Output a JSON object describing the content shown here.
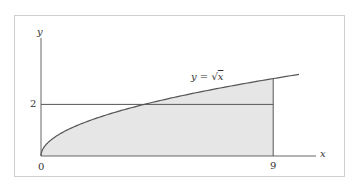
{
  "chart_data": {
    "type": "area",
    "title": "",
    "function_label": "y = √x",
    "function_label_parts": {
      "lhs": "y",
      "eq": "=",
      "radical": "√",
      "arg": "x"
    },
    "xlabel": "x",
    "ylabel": "y",
    "x_ticks": [
      {
        "value": 0,
        "label": "0"
      },
      {
        "value": 9,
        "label": "9"
      }
    ],
    "y_ticks": [
      {
        "value": 2,
        "label": "2"
      }
    ],
    "xlim": [
      0,
      10
    ],
    "ylim": [
      0,
      3.2
    ],
    "grid": false,
    "legend": null,
    "series": [
      {
        "name": "y = sqrt(x)",
        "kind": "curve",
        "x_range": [
          0,
          10
        ],
        "formula": "sqrt(x)"
      },
      {
        "name": "horizontal line y = 2",
        "kind": "hline",
        "y": 2,
        "x_range": [
          0,
          9
        ]
      },
      {
        "name": "vertical line x = 9",
        "kind": "vline",
        "x": 9,
        "y_range": [
          0,
          3
        ]
      },
      {
        "name": "shaded region under curve",
        "kind": "fill",
        "x_range": [
          0,
          9
        ],
        "under": "sqrt(x)"
      }
    ],
    "colors": {
      "fill": "#e6e6e6",
      "stroke": "#555555",
      "axis": "#666666",
      "frame": "#cfcfcf"
    }
  }
}
